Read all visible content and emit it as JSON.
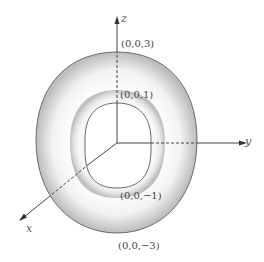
{
  "figure": {
    "axes": {
      "x_label": "x",
      "y_label": "y",
      "z_label": "z"
    },
    "points": {
      "outer_top": "(0,0,3)",
      "inner_top": "(0,0,1)",
      "inner_bottom": "(0,0,−1)",
      "outer_bottom": "(0,0,−3)"
    },
    "colors": {
      "outline": "#6a6a6a",
      "axis": "#444444",
      "shade_dark": "#9a9a9a",
      "shade_light": "#ffffff"
    }
  }
}
